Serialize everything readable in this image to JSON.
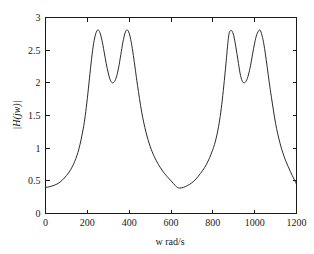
{
  "figure": {
    "background_color": "#ffffff",
    "axes_color": "#1a1a1a",
    "curve_color": "#2b2b2b"
  },
  "chart_data": {
    "type": "line",
    "title": "",
    "subtitle": "",
    "xlabel": "w rad/s",
    "ylabel": "|H(jw)|",
    "xlim": [
      0,
      1200
    ],
    "ylim": [
      0,
      3
    ],
    "xticks": [
      0,
      200,
      400,
      600,
      800,
      1000,
      1200
    ],
    "xtick_labels": [
      "0",
      "200",
      "400",
      "600",
      "800",
      "1000",
      "1200"
    ],
    "yticks": [
      0,
      0.5,
      1,
      1.5,
      2,
      2.5,
      3
    ],
    "ytick_labels": [
      "0",
      "0.5",
      "1",
      "1.5",
      "2",
      "2.5",
      "3"
    ],
    "grid": false,
    "legend": null,
    "legend_position": "none",
    "annotations": [],
    "series": [
      {
        "name": "|H(jw)|",
        "color": "#2b2b2b",
        "linewidth": 1,
        "x": [
          0,
          20,
          40,
          60,
          80,
          100,
          120,
          140,
          160,
          180,
          190,
          200,
          210,
          220,
          230,
          240,
          250,
          260,
          270,
          280,
          290,
          300,
          310,
          320,
          330,
          340,
          350,
          360,
          370,
          380,
          390,
          400,
          410,
          420,
          430,
          440,
          460,
          480,
          500,
          520,
          540,
          560,
          580,
          600,
          620,
          630,
          640,
          660,
          680,
          700,
          720,
          740,
          760,
          780,
          800,
          810,
          820,
          830,
          840,
          850,
          860,
          870,
          875,
          880,
          890,
          900,
          910,
          920,
          930,
          940,
          950,
          960,
          970,
          980,
          990,
          1000,
          1010,
          1020,
          1025,
          1030,
          1040,
          1050,
          1060,
          1070,
          1080,
          1100,
          1120,
          1140,
          1160,
          1180,
          1200
        ],
        "y": [
          0.4,
          0.41,
          0.43,
          0.46,
          0.51,
          0.58,
          0.67,
          0.8,
          0.99,
          1.29,
          1.5,
          1.76,
          2.06,
          2.36,
          2.6,
          2.75,
          2.81,
          2.77,
          2.65,
          2.48,
          2.3,
          2.15,
          2.04,
          2.0,
          2.02,
          2.1,
          2.24,
          2.43,
          2.62,
          2.76,
          2.81,
          2.76,
          2.62,
          2.42,
          2.19,
          1.96,
          1.55,
          1.25,
          1.03,
          0.87,
          0.75,
          0.65,
          0.57,
          0.5,
          0.43,
          0.4,
          0.39,
          0.4,
          0.43,
          0.47,
          0.53,
          0.61,
          0.7,
          0.82,
          0.98,
          1.08,
          1.21,
          1.38,
          1.6,
          1.88,
          2.2,
          2.55,
          2.7,
          2.78,
          2.8,
          2.72,
          2.55,
          2.35,
          2.15,
          2.03,
          2.0,
          2.03,
          2.12,
          2.26,
          2.44,
          2.61,
          2.74,
          2.8,
          2.81,
          2.78,
          2.66,
          2.47,
          2.24,
          2.0,
          1.78,
          1.38,
          1.09,
          0.88,
          0.72,
          0.58,
          0.45
        ]
      }
    ],
    "features": {
      "peaks": [
        {
          "x": 250,
          "y": 2.81
        },
        {
          "x": 390,
          "y": 2.81
        },
        {
          "x": 875,
          "y": 2.8
        },
        {
          "x": 1025,
          "y": 2.81
        }
      ],
      "local_minima": [
        {
          "x": 320,
          "y": 2.0
        },
        {
          "x": 630,
          "y": 0.39
        },
        {
          "x": 950,
          "y": 2.0
        }
      ],
      "endpoints": [
        {
          "x": 0,
          "y": 0.4
        },
        {
          "x": 1200,
          "y": 0.45
        }
      ]
    }
  }
}
